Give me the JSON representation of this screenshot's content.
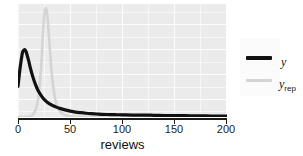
{
  "chart_data": {
    "type": "line",
    "title": "",
    "subtitle": "",
    "xlabel": "reviews",
    "ylabel": "",
    "xlim": [
      0,
      200
    ],
    "ylim": [
      0,
      0.105
    ],
    "xticks": [
      0,
      50,
      100,
      150,
      200
    ],
    "xtick_labels": [
      "0",
      "50",
      "100",
      "150",
      "200"
    ],
    "yticks": [],
    "ytick_labels": [],
    "grid": true,
    "grid_color": "#ffffff",
    "panel_background": "#ebebeb",
    "legend_position": "right",
    "legend_background": "#fbfbfb",
    "series": [
      {
        "name": "y",
        "label": "y",
        "color": "#111111",
        "linewidth": 3.2,
        "x": [
          0,
          2,
          4,
          5,
          6,
          7,
          8,
          10,
          12,
          14,
          16,
          18,
          20,
          24,
          28,
          32,
          36,
          40,
          45,
          50,
          55,
          60,
          65,
          70,
          75,
          80,
          85,
          90,
          95,
          100,
          110,
          120,
          130,
          140,
          150,
          160,
          170,
          180,
          190,
          200
        ],
        "y": [
          0.0285,
          0.0455,
          0.0585,
          0.0615,
          0.0625,
          0.062,
          0.06,
          0.053,
          0.045,
          0.038,
          0.032,
          0.0272,
          0.0232,
          0.0175,
          0.0138,
          0.0112,
          0.0094,
          0.008,
          0.0066,
          0.0055,
          0.0046,
          0.004,
          0.0035,
          0.0031,
          0.0028,
          0.0025,
          0.0023,
          0.0022,
          0.0021,
          0.002,
          0.0018,
          0.0018,
          0.0016,
          0.0014,
          0.0013,
          0.0012,
          0.0011,
          0.001,
          0.0009,
          0.0008
        ]
      },
      {
        "name": "y_rep",
        "label": "y",
        "label_subscript": "rep",
        "color": "#d4d4d4",
        "linewidth": 2.6,
        "x": [
          0,
          5,
          10,
          13,
          16,
          18,
          20,
          22,
          23,
          24,
          25,
          26,
          27,
          28,
          29,
          30,
          32,
          34,
          36,
          38,
          40,
          43,
          46,
          50,
          55,
          60,
          70,
          80,
          100,
          150,
          200
        ],
        "y": [
          0.0,
          0.0,
          0.0003,
          0.0012,
          0.0048,
          0.0105,
          0.0215,
          0.044,
          0.061,
          0.079,
          0.093,
          0.1,
          0.1005,
          0.095,
          0.084,
          0.07,
          0.044,
          0.026,
          0.015,
          0.009,
          0.0055,
          0.0028,
          0.0015,
          0.0007,
          0.0003,
          0.0001,
          0.0,
          0.0,
          0.0,
          0.0,
          0.0
        ]
      }
    ]
  },
  "legend": {
    "items": [
      {
        "label": "y",
        "subscript": "",
        "color": "#111111"
      },
      {
        "label": "y",
        "subscript": "rep",
        "color": "#d4d4d4"
      }
    ]
  },
  "axis": {
    "x_title": "reviews",
    "x_tick_labels": [
      "0",
      "50",
      "100",
      "150",
      "200"
    ]
  }
}
